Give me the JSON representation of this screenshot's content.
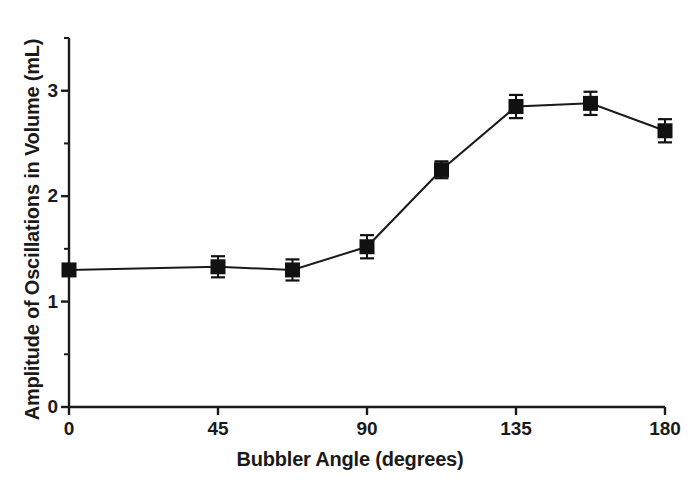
{
  "chart_data": {
    "type": "line",
    "title": "",
    "xlabel": "Bubbler Angle (degrees)",
    "ylabel": "Amplitude of Oscillations in Volume (mL)",
    "x": [
      0,
      45,
      67.5,
      90,
      112.5,
      135,
      157.5,
      180
    ],
    "values": [
      1.3,
      1.33,
      1.3,
      1.52,
      2.25,
      2.85,
      2.88,
      2.62
    ],
    "errors": [
      0.0,
      0.1,
      0.1,
      0.11,
      0.08,
      0.11,
      0.11,
      0.11
    ],
    "series": [
      {
        "name": "Amplitude of Oscillations in Volume",
        "values": [
          1.3,
          1.33,
          1.3,
          1.52,
          2.25,
          2.85,
          2.88,
          2.62
        ],
        "errors": [
          0.0,
          0.1,
          0.1,
          0.11,
          0.08,
          0.11,
          0.11,
          0.11
        ]
      }
    ],
    "xlim": [
      0,
      180
    ],
    "ylim": [
      0,
      3.5
    ],
    "xticks": [
      0,
      45,
      90,
      135,
      180
    ],
    "xtick_labels": [
      "0",
      "45",
      "90",
      "135",
      "180"
    ],
    "yticks": [
      0,
      1,
      2,
      3
    ],
    "ytick_labels": [
      "0",
      "1",
      "2",
      "3"
    ],
    "yminorticks": [
      0.5,
      1.5,
      2.5,
      3.5
    ],
    "grid": false,
    "legend": null,
    "marker": "filled-square",
    "marker_color": "#111111",
    "line_color": "#1a1a1a",
    "errorbar_color": "#111111",
    "axis_color": "#1a1a1a",
    "background": "#ffffff"
  },
  "axes": {
    "y_label_text": "Amplitude of Oscillations in Volume (mL)",
    "x_label_text": "Bubbler Angle (degrees)"
  }
}
